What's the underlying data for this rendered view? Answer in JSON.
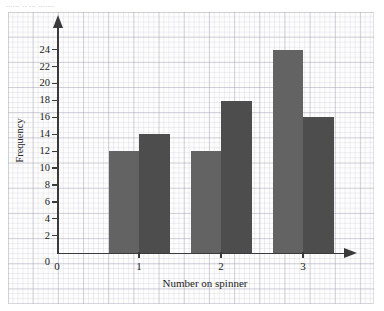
{
  "page": {
    "cut_off_text": "...... ..  ... ......."
  },
  "chart_data": {
    "type": "bar",
    "title": "",
    "xlabel": "Number on spinner",
    "ylabel": "Frequency",
    "categories": [
      "1",
      "2",
      "3"
    ],
    "x_tick_labels": [
      "0",
      "1",
      "2",
      "3"
    ],
    "y_tick_labels": [
      "2",
      "4",
      "6",
      "8",
      "10",
      "12",
      "14",
      "16",
      "18",
      "20",
      "22",
      "24"
    ],
    "y_origin_label": "0",
    "ylim": [
      0,
      26
    ],
    "y_step": 2,
    "grid": true,
    "legend": "none",
    "series": [
      {
        "name": "left",
        "values": [
          12,
          12,
          24
        ],
        "color": "#636363"
      },
      {
        "name": "right",
        "values": [
          14,
          18,
          16
        ],
        "color": "#4d4d4d"
      }
    ]
  },
  "colors": {
    "bar_left": "#636363",
    "bar_right": "#4d4d4d",
    "axis": "#3a3a3a",
    "grid_major": "#9696aa",
    "grid_minor": "#9696aa",
    "paper": "#fdfdfd",
    "text": "#222222"
  }
}
